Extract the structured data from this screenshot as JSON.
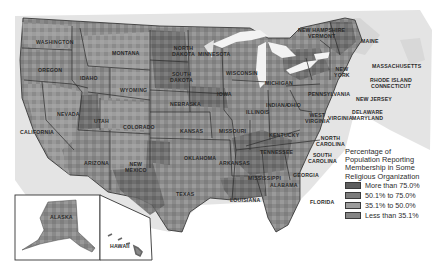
{
  "map": {
    "title": "Percentage of Population Reporting Membership in Some Religious Organization",
    "type": "choropleth",
    "region": "United States"
  },
  "legend": {
    "title_lines": [
      "Percentage of",
      "Population Reporting",
      "Membership in Some",
      "Religious Organization"
    ],
    "items": [
      {
        "label": "More than 75.0%",
        "color": "#5e5e5e"
      },
      {
        "label": "50.1% to 75.0%",
        "color": "#7c7c7c"
      },
      {
        "label": "35.1% to 50.0%",
        "color": "#9c9c9c"
      },
      {
        "label": "Less than 35.1%",
        "color": "#858585"
      }
    ]
  },
  "labels": {
    "washington": "Washington",
    "oregon": "Oregon",
    "idaho": "Idaho",
    "montana": "Montana",
    "wyoming": "Wyoming",
    "nevada": "Nevada",
    "california": "California",
    "utah": "Utah",
    "colorado": "Colorado",
    "arizona": "Arizona",
    "new_mexico_1": "New",
    "new_mexico_2": "Mexico",
    "north_dakota_1": "North",
    "north_dakota_2": "Dakota",
    "south_dakota_1": "South",
    "south_dakota_2": "Dakota",
    "nebraska": "Nebraska",
    "kansas": "Kansas",
    "oklahoma": "Oklahoma",
    "texas": "Texas",
    "minnesota": "Minnesota",
    "iowa": "Iowa",
    "missouri": "Missouri",
    "arkansas": "Arkansas",
    "louisiana": "Louisiana",
    "wisconsin": "Wisconsin",
    "illinois": "Illinois",
    "michigan": "Michigan",
    "indiana": "Indiana",
    "ohio": "Ohio",
    "kentucky": "Kentucky",
    "tennessee": "Tennessee",
    "mississippi": "Mississippi",
    "alabama": "Alabama",
    "georgia": "Georgia",
    "florida": "Florida",
    "south_carolina_1": "South",
    "south_carolina_2": "Carolina",
    "north_carolina_1": "North",
    "north_carolina_2": "Carolina",
    "virginia": "Virginia",
    "west_virginia_1": "West",
    "west_virginia_2": "Virginia",
    "pennsylvania": "Pennsylvania",
    "new_york_1": "New",
    "new_york_2": "York",
    "maine": "Maine",
    "new_hampshire": "New Hampshire",
    "vermont": "Vermont",
    "massachusetts": "Massachusetts",
    "rhode_island": "Rhode Island",
    "connecticut": "Connecticut",
    "new_jersey": "New Jersey",
    "delaware": "Delaware",
    "maryland": "Maryland",
    "alaska": "Alaska",
    "hawaii": "Hawaii"
  },
  "colors": {
    "background": "#ffffff",
    "water": "#e6e6e6",
    "border": "#2b2b2b",
    "lake": "#f2f2f2"
  }
}
